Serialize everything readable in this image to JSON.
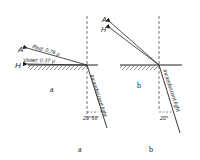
{
  "panels": [
    {
      "id": "a",
      "ray_a_label": "A",
      "ray_h_label": "H",
      "red_label": "Red: 0.76 μ",
      "violet_label": "Violet: 0.37 μ",
      "incident_label": "Incandescent light",
      "angle_label": "23°58'",
      "inner_caption": "a"
    },
    {
      "id": "b",
      "ray_a_label": "A",
      "ray_h_label": "H",
      "incident_label": "Incandescent light",
      "angle_label": "20°",
      "inner_caption": "b"
    }
  ],
  "captions": [
    "a",
    "b"
  ],
  "colors": {
    "ink": "#222222",
    "background": "#ffffff"
  }
}
